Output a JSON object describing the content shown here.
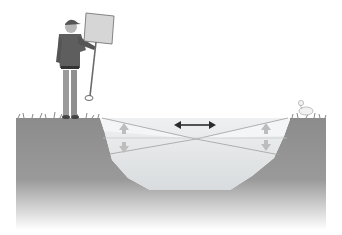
{
  "diagram": {
    "title": "",
    "elements": [
      {
        "id": "person",
        "label": "person holding sign and pole"
      },
      {
        "id": "pond",
        "label": "pond cross-section"
      },
      {
        "id": "horizontal-arrow",
        "label": "double-headed horizontal arrow"
      },
      {
        "id": "left-vertical-arrows",
        "label": "up/down arrows at left bank"
      },
      {
        "id": "right-vertical-arrows",
        "label": "up/down arrows at right bank"
      },
      {
        "id": "duck",
        "label": "bird on right bank"
      }
    ]
  },
  "colors": {
    "soil": "#8a8a8a",
    "soil_fade": "#ffffff",
    "water_top": "#e9ecee",
    "water_deep": "#d8dbdd",
    "arrow": "#2b2b2b",
    "vertical_arrow": "#b9b9b9"
  }
}
